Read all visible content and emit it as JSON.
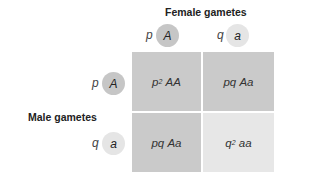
{
  "female": {
    "title": "Female gametes",
    "gametes": [
      {
        "freq": "p",
        "allele": "A",
        "color": "#c6c6c6"
      },
      {
        "freq": "q",
        "allele": "a",
        "color": "#e5e5e5"
      }
    ]
  },
  "male": {
    "title": "Male gametes",
    "gametes": [
      {
        "freq": "p",
        "allele": "A",
        "color": "#c6c6c6"
      },
      {
        "freq": "q",
        "allele": "a",
        "color": "#e5e5e5"
      }
    ]
  },
  "grid": {
    "cells": [
      {
        "freq": "p",
        "exp": "2",
        "genotype": "AA",
        "color": "#cacaca"
      },
      {
        "freq": "pq",
        "exp": "",
        "genotype": "Aa",
        "color": "#cacaca"
      },
      {
        "freq": "pq",
        "exp": "",
        "genotype": "Aa",
        "color": "#cacaca"
      },
      {
        "freq": "q",
        "exp": "2",
        "genotype": "aa",
        "color": "#e7e7e7"
      }
    ]
  }
}
